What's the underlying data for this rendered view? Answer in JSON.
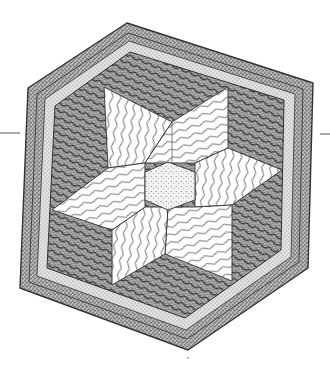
{
  "illustration": {
    "subject": "hexagonal quilt block with six-pointed star",
    "style": "stippled pen-and-ink drawing",
    "colors": {
      "background": "#ffffff",
      "ink": "#3a3a3a",
      "stipple_dark": "#8a8a8a",
      "stipple_light": "#c9c9c9",
      "star_fill": "#ffffff"
    },
    "outer_hexagon": [
      [
        127,
        23
      ],
      [
        313,
        83
      ],
      [
        308,
        268
      ],
      [
        188,
        350
      ],
      [
        20,
        288
      ],
      [
        28,
        88
      ]
    ],
    "star": {
      "points": [
        [
          104,
          87
        ],
        [
          228,
          87
        ],
        [
          282,
          170
        ],
        [
          232,
          281
        ],
        [
          112,
          285
        ],
        [
          52,
          210
        ]
      ],
      "notches": [
        [
          172,
          122
        ],
        [
          228,
          148
        ],
        [
          232,
          205
        ],
        [
          165,
          254
        ],
        [
          112,
          230
        ],
        [
          108,
          168
        ]
      ],
      "center": [
        168,
        185
      ]
    },
    "side_lines": {
      "left": {
        "x1": 0,
        "x2": 20,
        "y": 133
      },
      "right": {
        "x1": 320,
        "x2": 330,
        "y": 134
      }
    }
  }
}
